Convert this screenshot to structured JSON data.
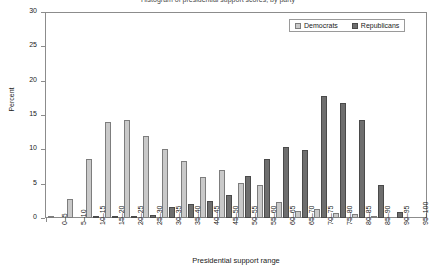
{
  "chart_data": {
    "type": "bar",
    "title": "Histogram of presidential support scores, by party",
    "xlabel": "Presidential support range",
    "ylabel": "Percent",
    "ylim": [
      0,
      30
    ],
    "yticks": [
      0,
      5,
      10,
      15,
      20,
      25,
      30
    ],
    "grid": false,
    "legend_position": "top-right",
    "categories": [
      "0–5",
      "5–10",
      "10–15",
      "15–20",
      "20–25",
      "25–30",
      "30–35",
      "35–40",
      "40–45",
      "45–50",
      "50–55",
      "55–60",
      "60–65",
      "65–70",
      "70–75",
      "75–80",
      "80–85",
      "85–90",
      "90–95",
      "95–100"
    ],
    "series": [
      {
        "name": "Democrats",
        "color": "#c9c9c9",
        "values": [
          0.3,
          2.8,
          8.7,
          14.1,
          14.3,
          12.0,
          10.1,
          8.3,
          6.0,
          7.0,
          5.1,
          4.9,
          2.3,
          1.0,
          1.3,
          0.8,
          0.6,
          0.3,
          0.0,
          0.0
        ]
      },
      {
        "name": "Republicans",
        "color": "#6e6e6e",
        "values": [
          0.0,
          0.0,
          0.15,
          0.15,
          0.3,
          0.45,
          1.6,
          2.0,
          2.5,
          3.3,
          6.1,
          8.7,
          10.4,
          9.9,
          17.8,
          16.9,
          14.4,
          4.8,
          0.9,
          0.0
        ]
      }
    ]
  },
  "legend": {
    "items": [
      {
        "label": "Democrats"
      },
      {
        "label": "Republicans"
      }
    ]
  }
}
